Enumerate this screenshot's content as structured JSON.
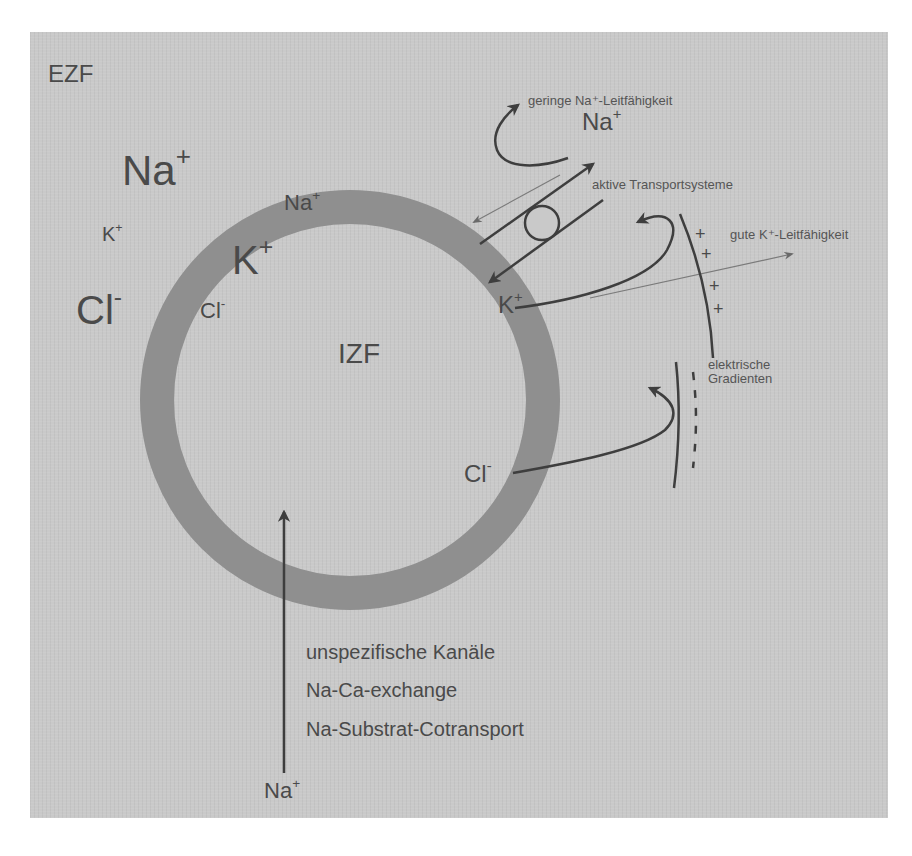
{
  "figure": {
    "title_ezf": "EZF",
    "title_izf": "IZF",
    "colors": {
      "panel_bg": "#c9c9c9",
      "membrane": "#8f8f8f",
      "ink": "#3e3e3e",
      "thin_line": "#7a7a7a"
    },
    "extracellular_ions": [
      {
        "symbol": "Na",
        "charge": "+",
        "size": "large"
      },
      {
        "symbol": "K",
        "charge": "+",
        "size": "small"
      },
      {
        "symbol": "Cl",
        "charge": "-",
        "size": "large"
      }
    ],
    "intracellular_ions": [
      {
        "symbol": "Na",
        "charge": "+",
        "size": "small"
      },
      {
        "symbol": "K",
        "charge": "+",
        "size": "large"
      },
      {
        "symbol": "Cl",
        "charge": "-",
        "size": "small"
      }
    ],
    "transport": {
      "na_ion": {
        "symbol": "Na",
        "charge": "+"
      },
      "k_ion": {
        "symbol": "K",
        "charge": "+"
      },
      "cl_ion": {
        "symbol": "Cl",
        "charge": "-"
      },
      "low_na_conductance": "geringe Na⁺-Leitfähigkeit",
      "active_transport": "aktive Transportsysteme",
      "good_k_conductance": "gute K⁺-Leitfähigkeit",
      "electric_gradients_line1": "elektrische",
      "electric_gradients_line2": "Gradienten",
      "plus_signs": [
        "+",
        "+",
        "+",
        "+"
      ]
    },
    "na_influx": {
      "ion": {
        "symbol": "Na",
        "charge": "+"
      },
      "mechanisms": [
        "unspezifische Kanäle",
        "Na-Ca-exchange",
        "Na-Substrat-Cotransport"
      ]
    }
  }
}
